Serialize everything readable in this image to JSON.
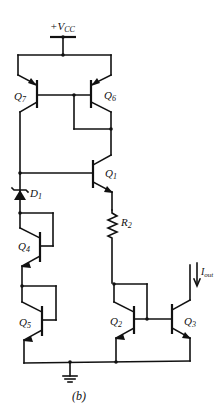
{
  "figure": {
    "caption": "(b)",
    "supply_label_main": "+V",
    "supply_label_sub": "CC",
    "output_current_label_main": "I",
    "output_current_label_sub": "out"
  },
  "components": {
    "Q7": {
      "main": "Q",
      "sub": "7",
      "type": "pnp"
    },
    "Q6": {
      "main": "Q",
      "sub": "6",
      "type": "pnp"
    },
    "Q1": {
      "main": "Q",
      "sub": "1",
      "type": "npn"
    },
    "D1": {
      "main": "D",
      "sub": "1",
      "type": "zener-diode"
    },
    "R2": {
      "main": "R",
      "sub": "2",
      "type": "resistor"
    },
    "Q4": {
      "main": "Q",
      "sub": "4",
      "type": "npn-diode-connected"
    },
    "Q5": {
      "main": "Q",
      "sub": "5",
      "type": "npn-diode-connected"
    },
    "Q2": {
      "main": "Q",
      "sub": "2",
      "type": "npn-diode-connected"
    },
    "Q3": {
      "main": "Q",
      "sub": "3",
      "type": "npn"
    }
  },
  "colors": {
    "ink": "#111111",
    "background": "#ffffff"
  }
}
